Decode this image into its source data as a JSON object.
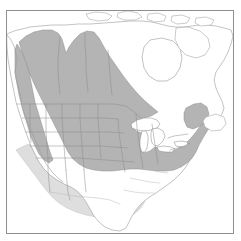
{
  "figure": {
    "type": "range-map",
    "region": "North America",
    "projection_frame": {
      "x": 6,
      "y": 10,
      "width": 228,
      "height": 224
    },
    "background_color": "#ffffff",
    "frame_color": "#8e8e8e"
  },
  "legend_colors": {
    "range_core": "#b4b4b4",
    "range_marginal": "#dedede",
    "land": "#ffffff",
    "outline": "#9a9a9a",
    "subdivision": "#8b8b8b",
    "lake": "#ffffff"
  },
  "layers": [
    {
      "id": "range-core",
      "name": "core-range-shading",
      "color": "#b4b4b4"
    },
    {
      "id": "range-marginal",
      "name": "marginal-range-shading",
      "color": "#dedede"
    },
    {
      "id": "land",
      "name": "land-outline",
      "color": "#ffffff"
    },
    {
      "id": "subdivisions",
      "name": "state-province-boundaries",
      "color": "#8b8b8b"
    },
    {
      "id": "lakes",
      "name": "great-lakes",
      "color": "#ffffff"
    }
  ],
  "geography": {
    "land_outline": "M 7 34 L 14 31 L 22 29 L 30 27 L 40 26 L 52 25 L 66 25 L 78 24 L 90 24 L 104 23 L 118 22 L 130 21 L 142 21 L 152 22 L 160 24 L 168 26 L 176 27 L 184 27 L 192 26 L 200 25 L 208 25 L 216 26 L 224 28 L 231 30 L 233 36 L 231 44 L 228 52 L 224 60 L 220 66 L 216 72 L 214 80 L 216 88 L 219 95 L 222 101 L 224 108 L 222 114 L 218 119 L 213 124 L 208 130 L 203 136 L 199 142 L 196 149 L 193 156 L 189 162 L 185 168 L 181 173 L 176 178 L 170 183 L 163 188 L 156 193 L 148 198 L 141 204 L 136 210 L 132 216 L 129 222 L 126 228 L 120 231 L 112 230 L 105 227 L 99 222 L 94 216 L 90 209 L 86 202 L 82 196 L 77 191 L 71 187 L 64 184 L 57 180 L 50 175 L 44 169 L 39 162 L 35 154 L 31 146 L 28 138 L 25 130 L 22 121 L 19 112 L 16 102 L 14 92 L 12 82 L 10 71 L 8 59 L 7 47 Z",
    "pacific_coast": "M 7 35 L 11 40 L 14 46 L 16 53 L 17 60 L 16 66 L 15 72 L 16 79 L 18 86 L 20 93 L 21 100 L 22 107 L 24 114 L 27 121 L 30 128 L 33 135 L 36 142 L 39 149 L 42 156 L 45 162 L 49 168 L 53 173 L 58 178 L 63 182",
    "great_lakes": [
      {
        "name": "lake-superior",
        "path": "M 131 124 L 137 120 L 144 118 L 151 118 L 157 120 L 160 124 L 157 128 L 151 130 L 144 131 L 137 130 L 132 128 Z"
      },
      {
        "name": "lake-michigan",
        "path": "M 142 131 L 146 131 L 148 136 L 148 142 L 147 148 L 145 152 L 142 152 L 140 147 L 140 140 L 141 135 Z"
      },
      {
        "name": "lake-huron",
        "path": "M 152 129 L 158 128 L 163 131 L 165 136 L 163 141 L 159 145 L 155 146 L 152 143 L 151 138 L 151 133 Z"
      },
      {
        "name": "lake-erie",
        "path": "M 157 147 L 164 146 L 171 147 L 175 149 L 172 152 L 165 152 L 159 151 Z"
      },
      {
        "name": "lake-ontario",
        "path": "M 174 142 L 181 141 L 187 142 L 188 145 L 183 147 L 176 146 Z"
      }
    ],
    "northern_islands": [
      {
        "name": "arctic-island-a",
        "path": "M 86 14 L 96 12 L 106 13 L 112 16 L 108 20 L 98 21 L 89 19 Z"
      },
      {
        "name": "arctic-island-b",
        "path": "M 118 13 L 128 11 L 138 13 L 142 17 L 135 20 L 124 20 L 117 17 Z"
      },
      {
        "name": "arctic-island-c",
        "path": "M 148 14 L 158 13 L 166 16 L 164 21 L 154 22 L 147 19 Z"
      },
      {
        "name": "arctic-island-d",
        "path": "M 172 16 L 182 15 L 190 18 L 187 23 L 177 24 L 171 21 Z"
      },
      {
        "name": "arctic-island-e",
        "path": "M 196 18 L 206 17 L 214 20 L 211 25 L 201 26 L 195 23 Z"
      },
      {
        "name": "baffin-island",
        "path": "M 176 28 L 188 27 L 200 31 L 208 38 L 210 47 L 205 55 L 196 58 L 186 55 L 179 48 L 175 39 Z"
      },
      {
        "name": "newfoundland",
        "path": "M 206 117 L 216 114 L 224 117 L 226 124 L 221 130 L 212 131 L 205 127 L 203 121 Z"
      }
    ],
    "hudson_bay": "M 150 40 L 162 38 L 173 41 L 180 48 L 182 58 L 180 68 L 175 76 L 167 81 L 157 81 L 149 76 L 144 68 L 142 57 L 144 47 Z"
  },
  "range": {
    "core_polygon": "M 19 42 L 26 36 L 34 32 L 43 30 L 52 30 L 58 33 L 62 39 L 64 46 L 66 53 L 69 47 L 74 40 L 80 34 L 87 31 L 94 32 L 99 38 L 104 47 L 110 57 L 117 67 L 124 77 L 131 86 L 138 94 L 145 101 L 152 107 L 158 112 L 151 116 L 144 118 L 137 121 L 132 126 L 136 131 L 142 133 L 141 140 L 140 148 L 144 153 L 150 151 L 155 147 L 161 148 L 168 150 L 175 150 L 181 147 L 186 143 L 191 138 L 196 132 L 201 125 L 206 119 L 209 124 L 207 131 L 203 138 L 199 145 L 196 152 L 192 158 L 187 163 L 181 167 L 174 170 L 166 171 L 157 171 L 148 170 L 139 169 L 130 169 L 121 170 L 112 171 L 103 171 L 94 170 L 86 168 L 79 164 L 73 159 L 68 152 L 64 144 L 60 136 L 56 128 L 52 120 L 48 112 L 44 104 L 40 96 L 36 88 L 32 79 L 28 70 L 25 61 L 22 52 Z",
    "core_west_lobe": "M 17 44 L 22 52 L 26 62 L 29 72 L 31 82 L 33 92 L 35 102 L 38 112 L 41 122 L 44 132 L 47 142 L 50 152 L 53 160 L 49 163 L 44 160 L 39 154 L 35 146 L 31 137 L 28 127 L 25 117 L 22 106 L 19 95 L 17 84 L 15 72 L 15 60 L 15 50 Z",
    "core_northeast_lobe": "M 186 108 L 194 104 L 201 103 L 207 107 L 209 114 L 206 121 L 200 126 L 193 129 L 187 127 L 184 120 L 184 113 Z",
    "marginal_southwest": "M 16 150 L 22 158 L 28 166 L 34 174 L 40 182 L 46 190 L 52 197 L 59 203 L 67 208 L 76 212 L 86 215 L 96 217 L 106 218 L 116 218 L 126 217 L 134 214 L 140 209 L 144 203 L 147 196 L 149 188 L 150 180 L 148 173 L 144 170 L 136 170 L 127 171 L 117 172 L 107 172 L 97 172 L 87 170 L 78 166 L 70 161 L 63 154 L 57 147 L 50 143 L 42 142 L 34 143 L 26 145 Z",
    "marginal_mexico_spur": "M 73 172 L 80 180 L 86 189 L 92 198 L 97 207 L 102 215 L 108 222 L 115 227 L 122 229 L 126 225 L 124 218 L 120 210 L 115 201 L 110 192 L 105 183 L 100 175 L 94 170 L 86 168 L 79 168 Z"
  },
  "subdivision_boundaries": [
    {
      "name": "canada-bc-alberta",
      "path": "M 60 36 L 59 48 L 58 60 L 58 72 L 59 84 L 60 94"
    },
    {
      "name": "canada-alberta-sask",
      "path": "M 85 33 L 85 45 L 86 57 L 86 69 L 87 81 L 88 92"
    },
    {
      "name": "canada-sask-manitoba",
      "path": "M 108 50 L 109 62 L 110 74 L 111 86 L 112 95"
    },
    {
      "name": "canada-usa-border",
      "path": "M 17 104 L 30 104 L 44 104 L 58 104 L 72 104 L 86 104 L 100 104 L 114 104 L 126 106 L 134 112 L 141 118"
    },
    {
      "name": "us-west-vertical-1",
      "path": "M 30 104 L 30 118 L 30 130 L 31 142"
    },
    {
      "name": "us-west-vertical-2",
      "path": "M 46 104 L 46 118 L 46 132 L 47 146 L 48 158"
    },
    {
      "name": "us-west-vertical-3",
      "path": "M 62 104 L 62 118 L 63 132 L 64 146 L 65 158 L 66 170"
    },
    {
      "name": "us-plains-vertical",
      "path": "M 80 104 L 80 118 L 81 132 L 82 146 L 83 158 L 84 170"
    },
    {
      "name": "us-midwest-vertical",
      "path": "M 98 104 L 98 118 L 99 132 L 100 146 L 101 158"
    },
    {
      "name": "us-horizontal-1",
      "path": "M 22 118 L 36 118 L 50 118 L 64 118 L 78 118 L 92 118 L 106 118 L 118 119"
    },
    {
      "name": "us-horizontal-2",
      "path": "M 26 132 L 40 132 L 54 132 L 68 132 L 82 132 L 96 132 L 110 132 L 124 133"
    },
    {
      "name": "us-horizontal-3",
      "path": "M 30 146 L 44 146 L 58 146 L 72 146 L 86 146 L 100 146 L 114 147 L 128 148"
    },
    {
      "name": "us-horizontal-4",
      "path": "M 36 158 L 50 158 L 64 158 L 78 158 L 92 159 L 106 160 L 120 161 L 134 162"
    },
    {
      "name": "us-east-vertical-1",
      "path": "M 118 119 L 119 133 L 121 147 L 123 160 L 125 172"
    },
    {
      "name": "us-east-vertical-2",
      "path": "M 136 114 L 137 128 L 139 142 L 141 155 L 143 168"
    },
    {
      "name": "us-east-vertical-3",
      "path": "M 152 124 L 154 138 L 156 151 L 158 164"
    },
    {
      "name": "us-northeast-1",
      "path": "M 168 138 L 174 136 L 181 135 L 188 134"
    },
    {
      "name": "us-northeast-2",
      "path": "M 170 150 L 177 148 L 184 146 L 190 143"
    },
    {
      "name": "us-southeast-1",
      "path": "M 145 168 L 152 170 L 160 172 L 168 173"
    },
    {
      "name": "us-southeast-2",
      "path": "M 130 178 L 140 180 L 150 182 L 160 183"
    },
    {
      "name": "us-southeast-3",
      "path": "M 124 190 L 134 192 L 144 193 L 154 193"
    },
    {
      "name": "us-southwest-1",
      "path": "M 48 158 L 48 170 L 49 182 L 50 192"
    },
    {
      "name": "us-southwest-2",
      "path": "M 66 170 L 67 182 L 68 192 L 70 200"
    },
    {
      "name": "us-southwest-3",
      "path": "M 84 170 L 85 182 L 86 192"
    },
    {
      "name": "mexico-boundary",
      "path": "M 50 192 L 62 194 L 74 196 L 86 197 L 98 198 L 110 200 L 120 204"
    }
  ]
}
